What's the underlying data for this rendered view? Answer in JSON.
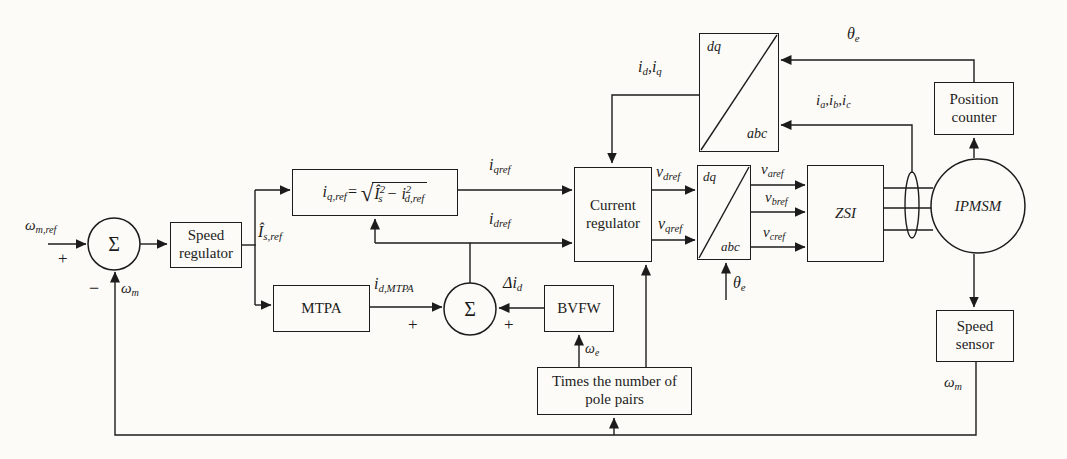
{
  "colors": {
    "ink": "#1c1c1c",
    "paper": "#fcfbf7"
  },
  "blocks": {
    "speed_regulator": "Speed regulator",
    "mtpa": "MTPA",
    "bvfw": "BVFW",
    "pole_pairs": "Times the number of pole pairs",
    "current_regulator": "Current regulator",
    "zsi": "ZSI",
    "ipmsm": "IPMSM",
    "position_counter": "Position counter",
    "speed_sensor": "Speed sensor",
    "dq": "dq",
    "abc": "abc"
  },
  "summing": {
    "sigma": "Σ",
    "plus": "+",
    "minus": "−"
  },
  "equation": {
    "lhs": "i_{q,ref}=",
    "radical": "√",
    "radicand": "Î^{2}_{s} − i^{2}_{d,ref}"
  },
  "signals": {
    "omega_m_ref": "ω_{m,ref}",
    "omega_m": "ω_{m}",
    "i_s_ref": "Î_{s,ref}",
    "i_qref": "i_{qref}",
    "i_dref": "i_{dref}",
    "i_d_mtpa": "i_{d,MTPA}",
    "delta_i_d": "Δi_{d}",
    "omega_e": "ω_{e}",
    "i_d_i_q": "i_{d},i_{q}",
    "v_dref": "v_{dref}",
    "v_qref": "v_{qref}",
    "v_aref": "v_{aref}",
    "v_bref": "v_{bref}",
    "v_cref": "v_{cref}",
    "theta_e": "θ_{e}",
    "i_a_i_b_i_c": "i_{a},i_{b},i_{c}"
  }
}
